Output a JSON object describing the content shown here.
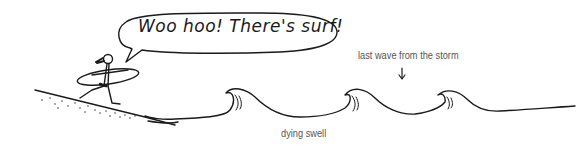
{
  "speech_bubble": {
    "text": "Woo hoo! There's surf!"
  },
  "annotations": {
    "last_wave": "last wave from the storm",
    "dying_swell": "dying swell"
  },
  "colors": {
    "ink": "#1a1a1a",
    "label": "#555555",
    "background": "#ffffff"
  }
}
